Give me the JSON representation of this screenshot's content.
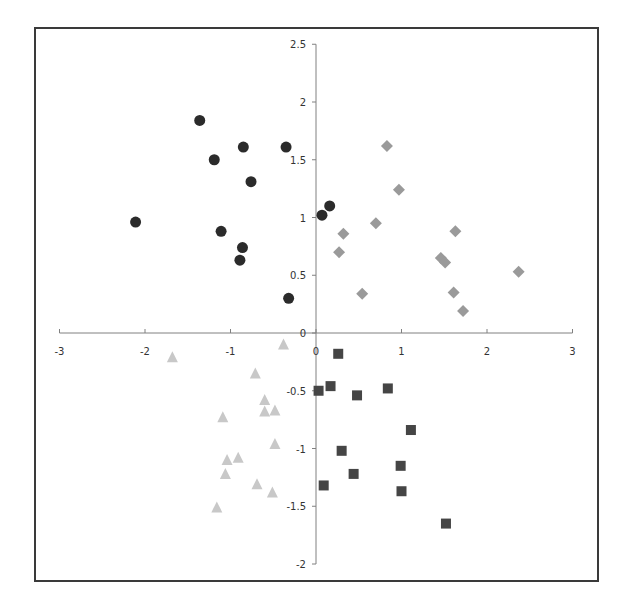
{
  "chart_data": {
    "type": "scatter",
    "title": "",
    "xlabel": "",
    "ylabel": "",
    "xlim": [
      -3,
      3
    ],
    "ylim": [
      -2,
      2.5
    ],
    "grid": false,
    "legend": null,
    "x_ticks": [
      "-3",
      "-2",
      "-1",
      "0",
      "1",
      "2",
      "3"
    ],
    "y_ticks": [
      "2.5",
      "2",
      "1.5",
      "1",
      "0.5",
      "0",
      "-0.5",
      "-1",
      "-1.5",
      "-2"
    ],
    "series": [
      {
        "name": "circles",
        "marker": "circle",
        "color": "#2b2b2b",
        "points": [
          [
            -2.11,
            0.96
          ],
          [
            -1.36,
            1.84
          ],
          [
            -1.19,
            1.5
          ],
          [
            -0.85,
            1.61
          ],
          [
            -0.35,
            1.61
          ],
          [
            -0.76,
            1.31
          ],
          [
            -1.11,
            0.88
          ],
          [
            -0.86,
            0.74
          ],
          [
            -0.89,
            0.63
          ],
          [
            -0.32,
            0.3
          ],
          [
            0.07,
            1.02
          ],
          [
            0.16,
            1.1
          ]
        ]
      },
      {
        "name": "diamonds",
        "marker": "diamond",
        "color": "#9a9a9a",
        "points": [
          [
            0.83,
            1.62
          ],
          [
            0.97,
            1.24
          ],
          [
            0.7,
            0.95
          ],
          [
            0.32,
            0.86
          ],
          [
            0.27,
            0.7
          ],
          [
            1.63,
            0.88
          ],
          [
            1.46,
            0.65
          ],
          [
            1.51,
            0.61
          ],
          [
            2.37,
            0.53
          ],
          [
            0.54,
            0.34
          ],
          [
            1.61,
            0.35
          ],
          [
            1.72,
            0.19
          ]
        ]
      },
      {
        "name": "triangles",
        "marker": "triangle",
        "color": "#c8c8c8",
        "points": [
          [
            -0.38,
            -0.1
          ],
          [
            -1.68,
            -0.21
          ],
          [
            -0.71,
            -0.35
          ],
          [
            -0.6,
            -0.58
          ],
          [
            -0.6,
            -0.68
          ],
          [
            -0.48,
            -0.67
          ],
          [
            -1.09,
            -0.73
          ],
          [
            -0.48,
            -0.96
          ],
          [
            -0.91,
            -1.08
          ],
          [
            -1.04,
            -1.1
          ],
          [
            -1.06,
            -1.22
          ],
          [
            -0.69,
            -1.31
          ],
          [
            -0.51,
            -1.38
          ],
          [
            -1.16,
            -1.51
          ]
        ]
      },
      {
        "name": "squares",
        "marker": "square",
        "color": "#454545",
        "points": [
          [
            0.26,
            -0.18
          ],
          [
            0.03,
            -0.5
          ],
          [
            0.17,
            -0.46
          ],
          [
            0.48,
            -0.54
          ],
          [
            0.84,
            -0.48
          ],
          [
            1.11,
            -0.84
          ],
          [
            0.3,
            -1.02
          ],
          [
            0.99,
            -1.15
          ],
          [
            0.44,
            -1.22
          ],
          [
            0.09,
            -1.32
          ],
          [
            1.0,
            -1.37
          ],
          [
            1.52,
            -1.65
          ]
        ]
      }
    ]
  },
  "layout": {
    "x_origin_px": 316,
    "y_origin_px": 333,
    "x_unit_px": 85.5,
    "y_unit_px": 115.5
  }
}
